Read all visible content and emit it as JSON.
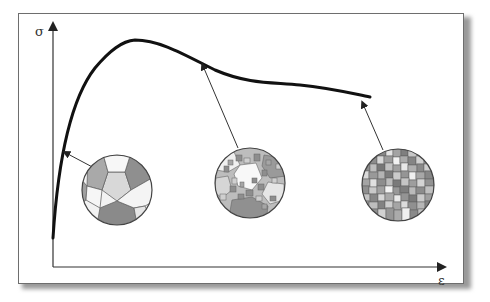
{
  "figure": {
    "type": "stress-strain diagram with microstructure insets",
    "y_axis_label": "σ",
    "x_axis_label": "ε",
    "curve_color": "#111111",
    "axis_color": "#333333",
    "grain_colors": [
      "#8c8c8c",
      "#a8a8a8",
      "#c4c4c4",
      "#dadada",
      "#f4f4f4",
      "#777777"
    ]
  },
  "insets": [
    {
      "name": "coarse-grain",
      "label": "",
      "points_to": "early elastic region"
    },
    {
      "name": "medium-grain",
      "label": "",
      "points_to": "post-peak region"
    },
    {
      "name": "fine-grain",
      "label": "",
      "points_to": "end of curve"
    }
  ]
}
